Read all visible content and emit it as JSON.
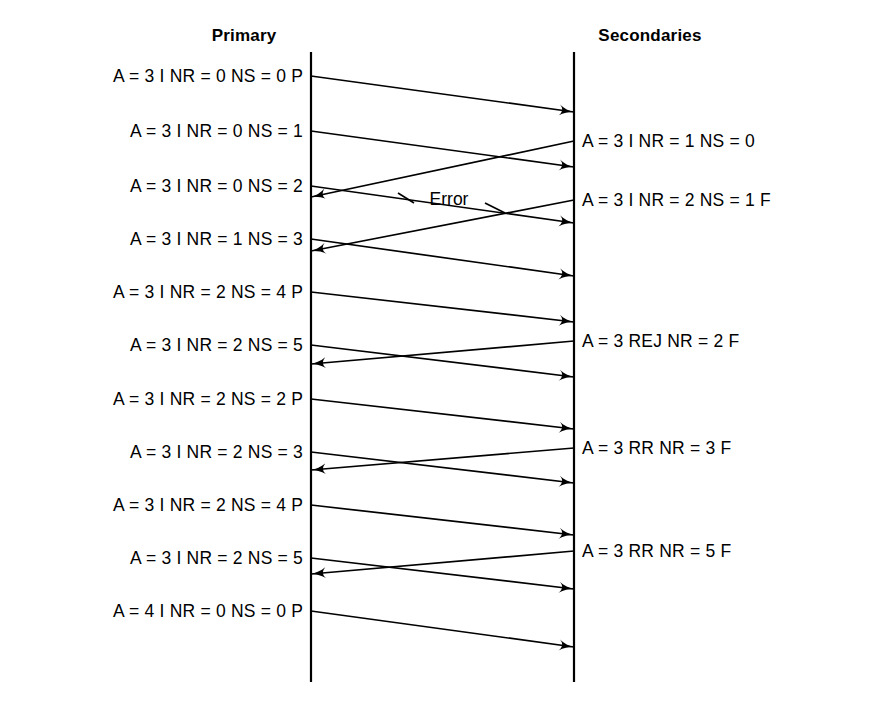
{
  "figure": {
    "title": "",
    "background": "#ffffff",
    "ink": "#000000",
    "width": 884,
    "height": 710
  },
  "headers": [
    {
      "label": "Primary",
      "x": 244,
      "y": 38
    },
    {
      "label": "Secondaries",
      "x": 650,
      "y": 38
    }
  ],
  "lifelines": [
    {
      "name": "primary",
      "x": 311,
      "y1": 52,
      "y2": 682
    },
    {
      "name": "secondaries",
      "x": 574,
      "y1": 52,
      "y2": 682
    }
  ],
  "left_messages": [
    {
      "text": "A = 3   I  NR = 0  NS = 0   P",
      "x": 303,
      "y": 76
    },
    {
      "text": "A = 3   I  NR = 0  NS = 1",
      "x": 303,
      "y": 131
    },
    {
      "text": "A = 3   I  NR = 0  NS = 2",
      "x": 303,
      "y": 186
    },
    {
      "text": "A = 3   I  NR = 1  NS = 3",
      "x": 303,
      "y": 239
    },
    {
      "text": "A = 3   I  NR = 2  NS = 4   P",
      "x": 303,
      "y": 292
    },
    {
      "text": "A = 3   I  NR = 2  NS = 5",
      "x": 303,
      "y": 345
    },
    {
      "text": "A = 3   I  NR = 2  NS = 2   P",
      "x": 303,
      "y": 399
    },
    {
      "text": "A = 3   I  NR = 2  NS = 3",
      "x": 303,
      "y": 452
    },
    {
      "text": "A = 3   I  NR = 2  NS = 4   P",
      "x": 303,
      "y": 505
    },
    {
      "text": "A = 3   I  NR = 2  NS = 5",
      "x": 303,
      "y": 558
    },
    {
      "text": "A = 4   I  NR = 0  NS = 0   P",
      "x": 303,
      "y": 611
    }
  ],
  "right_messages": [
    {
      "text": "A = 3   I  NR = 1  NS = 0",
      "x": 582,
      "y": 141
    },
    {
      "text": "A = 3   I  NR = 2  NS = 1   F",
      "x": 582,
      "y": 200
    },
    {
      "text": "A = 3  REJ  NR = 2   F",
      "x": 582,
      "y": 341
    },
    {
      "text": "A = 3  RR  NR = 3   F",
      "x": 582,
      "y": 448
    },
    {
      "text": "A = 3  RR  NR = 5   F",
      "x": 582,
      "y": 551
    }
  ],
  "annotations": [
    {
      "name": "error-label",
      "text": "Error",
      "x": 449,
      "y": 199,
      "leaders": [
        {
          "x1": 414,
          "y1": 203,
          "x2": 398,
          "y2": 193
        },
        {
          "x1": 485,
          "y1": 203,
          "x2": 505,
          "y2": 213
        }
      ]
    }
  ],
  "arrows": [
    {
      "name": "arrow-p2s-1",
      "dir": "to-secondary",
      "x1": 311,
      "y1": 76,
      "x2": 574,
      "y2": 112
    },
    {
      "name": "arrow-p2s-2",
      "dir": "to-secondary",
      "x1": 311,
      "y1": 131,
      "x2": 574,
      "y2": 167
    },
    {
      "name": "arrow-s2p-1",
      "dir": "to-primary",
      "x1": 574,
      "y1": 141,
      "x2": 311,
      "y2": 197
    },
    {
      "name": "arrow-p2s-3",
      "dir": "to-secondary",
      "x1": 311,
      "y1": 186,
      "x2": 574,
      "y2": 223
    },
    {
      "name": "arrow-s2p-2",
      "dir": "to-primary",
      "x1": 574,
      "y1": 200,
      "x2": 311,
      "y2": 251
    },
    {
      "name": "arrow-p2s-4",
      "dir": "to-secondary",
      "x1": 311,
      "y1": 239,
      "x2": 574,
      "y2": 276
    },
    {
      "name": "arrow-p2s-5",
      "dir": "to-secondary",
      "x1": 311,
      "y1": 292,
      "x2": 574,
      "y2": 322
    },
    {
      "name": "arrow-p2s-6",
      "dir": "to-secondary",
      "x1": 311,
      "y1": 345,
      "x2": 574,
      "y2": 377
    },
    {
      "name": "arrow-s2p-3",
      "dir": "to-primary",
      "x1": 574,
      "y1": 341,
      "x2": 311,
      "y2": 364
    },
    {
      "name": "arrow-p2s-7",
      "dir": "to-secondary",
      "x1": 311,
      "y1": 399,
      "x2": 574,
      "y2": 429
    },
    {
      "name": "arrow-p2s-8",
      "dir": "to-secondary",
      "x1": 311,
      "y1": 452,
      "x2": 574,
      "y2": 483
    },
    {
      "name": "arrow-s2p-4",
      "dir": "to-primary",
      "x1": 574,
      "y1": 448,
      "x2": 311,
      "y2": 470
    },
    {
      "name": "arrow-p2s-9",
      "dir": "to-secondary",
      "x1": 311,
      "y1": 505,
      "x2": 574,
      "y2": 535
    },
    {
      "name": "arrow-p2s-10",
      "dir": "to-secondary",
      "x1": 311,
      "y1": 558,
      "x2": 574,
      "y2": 589
    },
    {
      "name": "arrow-s2p-5",
      "dir": "to-primary",
      "x1": 574,
      "y1": 551,
      "x2": 311,
      "y2": 574
    },
    {
      "name": "arrow-p2s-11",
      "dir": "to-secondary",
      "x1": 311,
      "y1": 611,
      "x2": 574,
      "y2": 647
    }
  ]
}
